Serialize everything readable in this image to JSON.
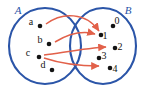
{
  "diagram": {
    "type": "mapping",
    "colors": {
      "set_outline": "#2b55a8",
      "set_label": "#2b55a8",
      "arrow": "#e2614a",
      "element_dot": "#141414",
      "element_label": "#141414",
      "background": "#ffffff"
    },
    "sets": [
      {
        "name": "set-a",
        "label": "A",
        "label_pos": {
          "x": 18,
          "y": 14
        },
        "ellipse": {
          "cx": 45,
          "cy": 46,
          "rx": 36,
          "ry": 38
        },
        "elements": [
          {
            "id": "a",
            "label": "a",
            "dot": {
              "x": 40,
              "y": 26
            },
            "label_pos": {
              "x": 31,
              "y": 25
            }
          },
          {
            "id": "b",
            "label": "b",
            "dot": {
              "x": 49,
              "y": 44
            },
            "label_pos": {
              "x": 40,
              "y": 43
            }
          },
          {
            "id": "c",
            "label": "c",
            "dot": {
              "x": 39,
              "y": 57
            },
            "label_pos": {
              "x": 28,
              "y": 56
            }
          },
          {
            "id": "d",
            "label": "d",
            "dot": {
              "x": 52,
              "y": 70
            },
            "label_pos": {
              "x": 43,
              "y": 68
            }
          }
        ]
      },
      {
        "name": "set-b",
        "label": "B",
        "label_pos": {
          "x": 128,
          "y": 14
        },
        "ellipse": {
          "cx": 103,
          "cy": 46,
          "rx": 33,
          "ry": 38
        },
        "elements": [
          {
            "id": "0",
            "label": "0",
            "dot": {
              "x": 113,
              "y": 26
            },
            "label_pos": {
              "x": 117,
              "y": 24
            }
          },
          {
            "id": "1",
            "label": "1",
            "dot": {
              "x": 101,
              "y": 35
            },
            "label_pos": {
              "x": 105,
              "y": 39
            }
          },
          {
            "id": "2",
            "label": "2",
            "dot": {
              "x": 115,
              "y": 48
            },
            "label_pos": {
              "x": 120,
              "y": 50
            }
          },
          {
            "id": "3",
            "label": "3",
            "dot": {
              "x": 99,
              "y": 58
            },
            "label_pos": {
              "x": 104,
              "y": 59
            }
          },
          {
            "id": "4",
            "label": "4",
            "dot": {
              "x": 110,
              "y": 68
            },
            "label_pos": {
              "x": 115,
              "y": 72
            }
          }
        ]
      }
    ],
    "arrows": [
      {
        "name": "arrow-a-to-1",
        "from": "a",
        "to": "1",
        "path": "M 46 24 C 62 12, 86 12, 99 31"
      },
      {
        "name": "arrow-b-to-1",
        "from": "b",
        "to": "1",
        "path": "M 55 42 C 70 33, 84 31, 95 34"
      },
      {
        "name": "arrow-c-to-2",
        "from": "c",
        "to": "2",
        "path": "M 44 55 C 66 52, 88 48, 106 47"
      },
      {
        "name": "arrow-c-to-4",
        "from": "c",
        "to": "4",
        "path": "M 44 58 C 62 64, 82 66, 99 66"
      }
    ]
  }
}
